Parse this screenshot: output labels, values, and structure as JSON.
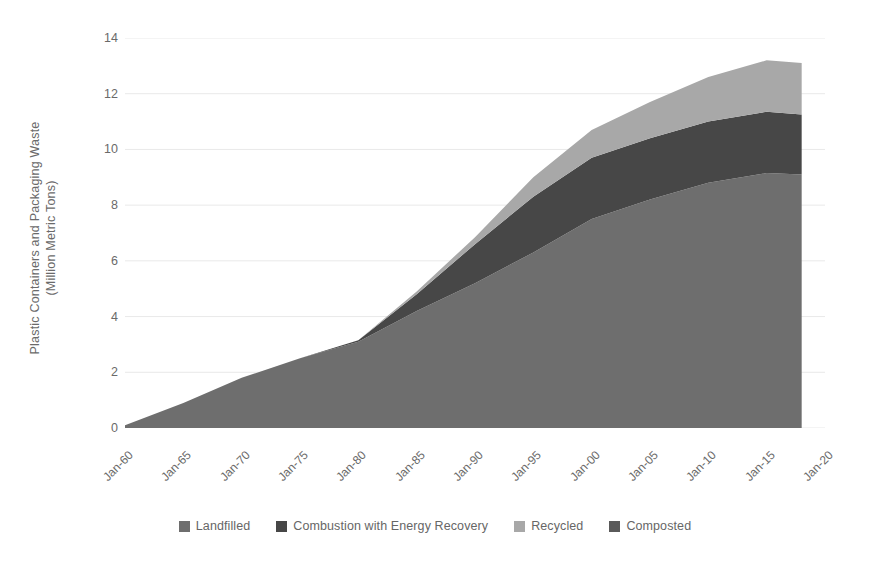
{
  "chart_data": {
    "type": "area",
    "stacked": true,
    "title": "",
    "xlabel": "",
    "ylabel": "Plastic Containers and Packaging Waste\n(Million Metric Tons)",
    "ylim": [
      0,
      14
    ],
    "y_ticks": [
      0,
      2,
      4,
      6,
      8,
      10,
      12,
      14
    ],
    "grid": "horizontal",
    "legend_position": "bottom-center",
    "categories": [
      "Jan-60",
      "Jan-65",
      "Jan-70",
      "Jan-75",
      "Jan-80",
      "Jan-85",
      "Jan-90",
      "Jan-95",
      "Jan-00",
      "Jan-05",
      "Jan-10",
      "Jan-15",
      "Jan-20"
    ],
    "x_tick_labels": [
      "Jan-60",
      "Jan-65",
      "Jan-70",
      "Jan-75",
      "Jan-80",
      "Jan-85",
      "Jan-90",
      "Jan-95",
      "Jan-00",
      "Jan-05",
      "Jan-10",
      "Jan-15",
      "Jan-20"
    ],
    "x": [
      1960,
      1965,
      1970,
      1975,
      1980,
      1985,
      1990,
      1995,
      2000,
      2005,
      2010,
      2015,
      2018
    ],
    "series": [
      {
        "name": "Landfilled",
        "color": "#6e6e6e",
        "values": [
          0.1,
          0.9,
          1.8,
          2.5,
          3.1,
          4.2,
          5.2,
          6.3,
          7.5,
          8.2,
          8.8,
          9.15,
          9.1
        ]
      },
      {
        "name": "Combustion with Energy Recovery",
        "color": "#474747",
        "values": [
          0.0,
          0.0,
          0.0,
          0.0,
          0.05,
          0.6,
          1.4,
          2.0,
          2.2,
          2.2,
          2.2,
          2.2,
          2.15
        ]
      },
      {
        "name": "Recycled",
        "color": "#a8a8a8",
        "values": [
          0.0,
          0.0,
          0.0,
          0.0,
          0.0,
          0.1,
          0.25,
          0.7,
          1.0,
          1.3,
          1.6,
          1.85,
          1.85
        ]
      },
      {
        "name": "Composted",
        "color": "#5a5a5a",
        "values": [
          0.0,
          0.0,
          0.0,
          0.0,
          0.0,
          0.0,
          0.0,
          0.0,
          0.0,
          0.0,
          0.0,
          0.0,
          0.0
        ]
      }
    ],
    "totals": [
      0.1,
      0.9,
      1.8,
      2.5,
      3.15,
      4.9,
      6.85,
      9.0,
      10.7,
      11.7,
      12.6,
      13.2,
      13.1
    ],
    "annotations": [],
    "background_color": "#ffffff",
    "gridline_color": "#e9e9e9",
    "text_color": "#6a6a6a"
  },
  "legend": {
    "items": [
      {
        "label": "Landfilled",
        "color": "#6e6e6e"
      },
      {
        "label": "Combustion with Energy Recovery",
        "color": "#474747"
      },
      {
        "label": "Recycled",
        "color": "#a8a8a8"
      },
      {
        "label": "Composted",
        "color": "#5a5a5a"
      }
    ]
  },
  "axes": {
    "y_title": "Plastic Containers and Packaging Waste\n(Million Metric Tons)",
    "y_tick_labels": [
      "14",
      "12",
      "10",
      "8",
      "6",
      "4",
      "2",
      "0"
    ]
  }
}
